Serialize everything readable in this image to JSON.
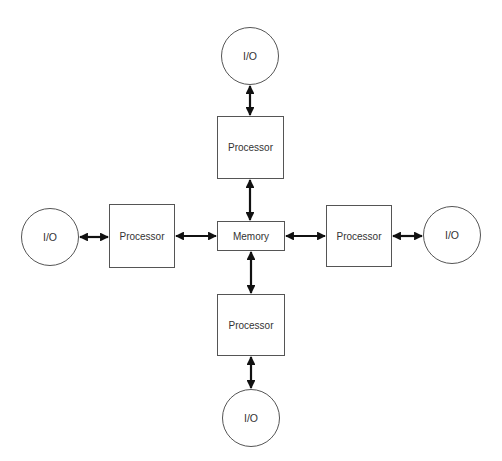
{
  "diagram": {
    "nodes": {
      "io_top": {
        "label": "I/O",
        "shape": "circle"
      },
      "proc_top": {
        "label": "Processor",
        "shape": "box"
      },
      "memory": {
        "label": "Memory",
        "shape": "box"
      },
      "proc_bottom": {
        "label": "Processor",
        "shape": "box"
      },
      "io_bottom": {
        "label": "I/O",
        "shape": "circle"
      },
      "io_left": {
        "label": "I/O",
        "shape": "circle"
      },
      "proc_left": {
        "label": "Processor",
        "shape": "box"
      },
      "proc_right": {
        "label": "Processor",
        "shape": "box"
      },
      "io_right": {
        "label": "I/O",
        "shape": "circle"
      }
    },
    "edges": [
      {
        "from": "io_top",
        "to": "proc_top",
        "type": "bidirectional"
      },
      {
        "from": "proc_top",
        "to": "memory",
        "type": "bidirectional"
      },
      {
        "from": "memory",
        "to": "proc_bottom",
        "type": "bidirectional"
      },
      {
        "from": "proc_bottom",
        "to": "io_bottom",
        "type": "bidirectional"
      },
      {
        "from": "io_left",
        "to": "proc_left",
        "type": "bidirectional"
      },
      {
        "from": "proc_left",
        "to": "memory",
        "type": "bidirectional"
      },
      {
        "from": "memory",
        "to": "proc_right",
        "type": "bidirectional"
      },
      {
        "from": "proc_right",
        "to": "io_right",
        "type": "bidirectional"
      }
    ],
    "colors": {
      "line": "#111111",
      "border": "#555555",
      "text": "#333333",
      "background": "#ffffff"
    }
  }
}
